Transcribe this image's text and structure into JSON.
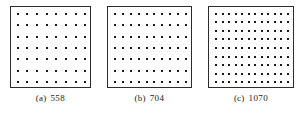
{
  "figure": {
    "background_color": "#ffffff",
    "border_color": "#2b2b2b",
    "dot_color": "#1a1a1a",
    "panels": [
      {
        "id": "a",
        "tag": "(a)",
        "count_label": "558",
        "grid_rows": 7,
        "grid_cols": 8,
        "dot_size_px": 2,
        "box_width_px": 81,
        "box_height_px": 82
      },
      {
        "id": "b",
        "tag": "(b)",
        "count_label": "704",
        "grid_rows": 7,
        "grid_cols": 10,
        "dot_size_px": 2,
        "box_width_px": 85,
        "box_height_px": 82
      },
      {
        "id": "c",
        "tag": "(c)",
        "count_label": "1070",
        "grid_rows": 9,
        "grid_cols": 12,
        "dot_size_px": 2,
        "box_width_px": 86,
        "box_height_px": 82
      }
    ]
  },
  "chart_data": {
    "type": "scatter",
    "title": "",
    "xlabel": "",
    "ylabel": "",
    "categories": [
      "(a)",
      "(b)",
      "(c)"
    ],
    "values": [
      558,
      704,
      1070
    ],
    "series": [
      {
        "name": "dot count label",
        "values": [
          558,
          704,
          1070
        ]
      },
      {
        "name": "grid rows",
        "values": [
          7,
          7,
          9
        ]
      },
      {
        "name": "grid columns",
        "values": [
          8,
          10,
          12
        ]
      }
    ],
    "grid": true,
    "legend": "none"
  }
}
